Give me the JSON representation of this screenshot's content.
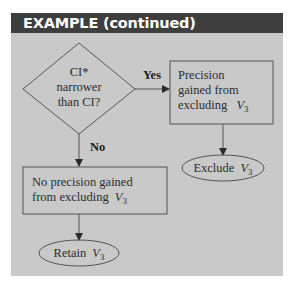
{
  "header": {
    "title": "EXAMPLE (continued)"
  },
  "colors": {
    "header_bg": "#3e3e3e",
    "panel_bg": "#c9c9c9",
    "stroke": "#555555",
    "text": "#2b2b2b"
  },
  "decision": {
    "lines": [
      "CI*",
      "narrower",
      "than CI?"
    ]
  },
  "edges": {
    "yes_label": "Yes",
    "no_label": "No"
  },
  "precision_box": {
    "lines": [
      "Precision",
      "gained from",
      "excluding"
    ],
    "var": "V",
    "sub": "3"
  },
  "no_precision_box": {
    "line1": "No precision gained",
    "line2": "from excluding",
    "var": "V",
    "sub": "3"
  },
  "exclude_oval": {
    "text": "Exclude",
    "var": "V",
    "sub": "3"
  },
  "retain_oval": {
    "text": "Retain",
    "var": "V",
    "sub": "3"
  }
}
